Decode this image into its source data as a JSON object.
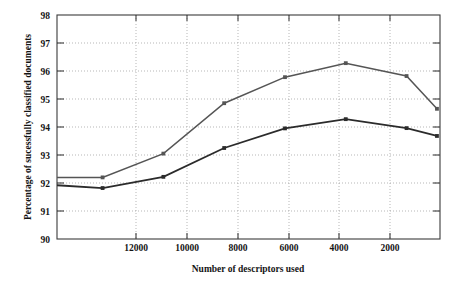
{
  "chart_data": {
    "type": "line",
    "title": "",
    "xlabel": "Number of descriptors used",
    "ylabel": "Percentage of sucessfully classified documents",
    "x": [
      13500,
      12000,
      10000,
      8000,
      6000,
      4000,
      2000,
      1000
    ],
    "xtick_values": [
      12000,
      10000,
      8000,
      6000,
      4000,
      2000
    ],
    "xtick_labels": [
      "12000",
      "10000",
      "8000",
      "6000",
      "4000",
      "2000"
    ],
    "ytick_values": [
      90,
      91,
      92,
      93,
      94,
      95,
      96,
      97,
      98
    ],
    "ytick_labels": [
      "90",
      "91",
      "92",
      "93",
      "94",
      "95",
      "96",
      "97",
      "98"
    ],
    "xlim": [
      13500,
      900
    ],
    "ylim": [
      90,
      98
    ],
    "x_axis_reversed": true,
    "grid": true,
    "grid_style": "dotted",
    "legend": "none",
    "series": [
      {
        "name": "upper-curve",
        "color": "#555555",
        "values": [
          92.2,
          92.2,
          93.05,
          94.85,
          95.78,
          96.28,
          95.82,
          94.65
        ]
      },
      {
        "name": "lower-curve",
        "color": "#2b2b2b",
        "values": [
          91.92,
          91.82,
          92.22,
          93.25,
          93.95,
          94.28,
          93.96,
          93.68
        ]
      }
    ]
  },
  "axes": {
    "y_label_text": "Percentage of sucessfully classified documents",
    "x_label_text": "Number of descriptors used"
  },
  "ylabels": {
    "t0": "90",
    "t1": "91",
    "t2": "92",
    "t3": "93",
    "t4": "94",
    "t5": "95",
    "t6": "96",
    "t7": "97",
    "t8": "98"
  },
  "xlabels": {
    "t0": "12000",
    "t1": "10000",
    "t2": "8000",
    "t3": "6000",
    "t4": "4000",
    "t5": "2000"
  },
  "colors": {
    "upper_series": "#555555",
    "lower_series": "#2b2b2b",
    "frame": "#3b3b3b",
    "grid": "#9a9a9a",
    "background": "#ffffff"
  }
}
